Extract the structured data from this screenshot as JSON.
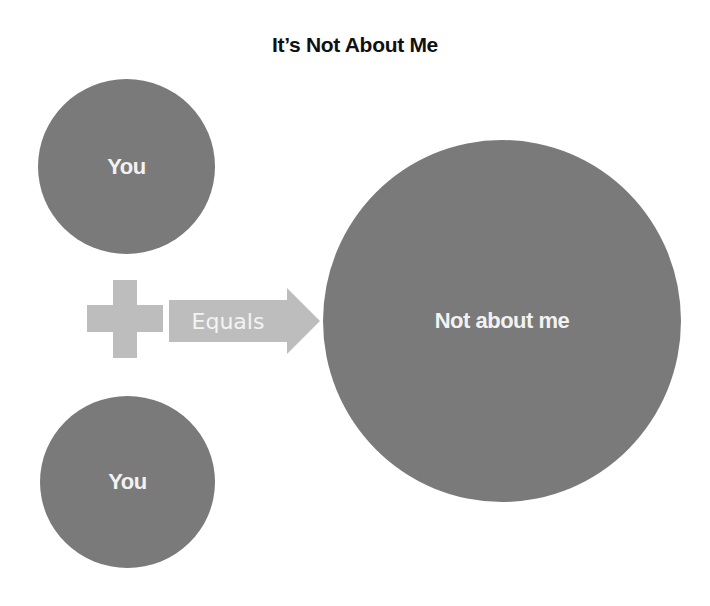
{
  "diagram": {
    "title": "It’s Not About Me",
    "nodes": [
      {
        "id": "you-top",
        "label": "You",
        "shape": "circle"
      },
      {
        "id": "you-bottom",
        "label": "You",
        "shape": "circle"
      },
      {
        "id": "result",
        "label": "Not about me",
        "shape": "circle"
      }
    ],
    "operator": {
      "symbol": "plus",
      "icon": "plus-icon"
    },
    "arrow": {
      "label": "Equals",
      "icon": "right-arrow-icon"
    },
    "colors": {
      "circle_fill": "#7a7a7a",
      "circle_text": "#f2f2f2",
      "connector_fill": "#bdbdbd",
      "title_text": "#111111"
    }
  }
}
